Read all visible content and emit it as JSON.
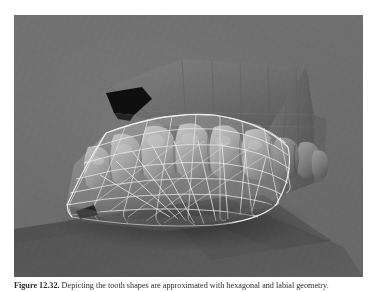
{
  "figure": {
    "caption_label": "Figure 12.32.",
    "caption_text": "Depicting the tooth shapes are approximated with hexagonal and labial geometry.",
    "panel": {
      "background_color": "#6e6e6e",
      "width_px": 349,
      "height_px": 262
    }
  },
  "scene": {
    "title": "3D dental arch render",
    "description": "Shaded three-dimensional render of an upper dental arch and palate viewed from the lower-left, overlaid by a white quadrilateral wireframe mesh representing the soft-tissue / tongue surface, cast onto a darker ground plane.",
    "objects": [
      {
        "name": "palate-block",
        "label": "Palate / maxilla block",
        "fill": "#6a6a6a"
      },
      {
        "name": "dark-aperture",
        "label": "Dark aperture in palate",
        "fill": "#121212"
      },
      {
        "name": "tooth-row",
        "label": "Upper tooth row",
        "count": 9,
        "fill": "#9a9a9a"
      },
      {
        "name": "wireframe-mesh",
        "label": "Quadrilateral wireframe mesh",
        "stroke": "#e8e8e8"
      },
      {
        "name": "ground-plane",
        "label": "Shadow ground plane",
        "fill": "#555555"
      }
    ],
    "colors": {
      "background": "#6e6e6e",
      "shadow_plane": "#555555",
      "wireframe_stroke": "#e9e9e9",
      "tooth_highlight": "#b4b4b4",
      "tooth_shadow": "#5e5e5e",
      "aperture": "#101010",
      "page_background": "#ffffff"
    }
  }
}
